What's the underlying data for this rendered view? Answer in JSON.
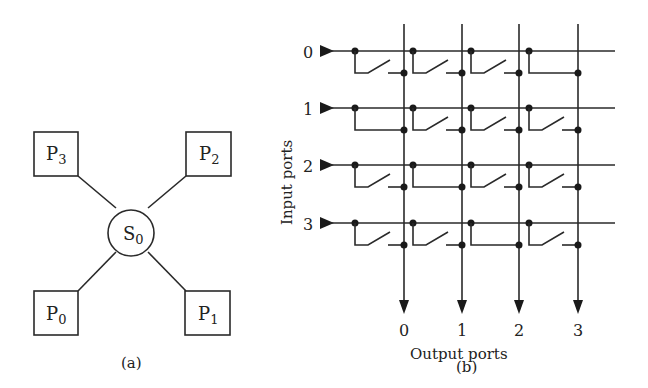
{
  "figure_a": {
    "caption": "(a)",
    "switch": {
      "label": "S",
      "sub": "0"
    },
    "processors": [
      {
        "id": "P0",
        "label": "P",
        "sub": "0",
        "position": "bottom-left"
      },
      {
        "id": "P1",
        "label": "P",
        "sub": "1",
        "position": "bottom-right"
      },
      {
        "id": "P2",
        "label": "P",
        "sub": "2",
        "position": "top-right"
      },
      {
        "id": "P3",
        "label": "P",
        "sub": "3",
        "position": "top-left"
      }
    ]
  },
  "figure_b": {
    "caption": "(b)",
    "input_axis_label": "Input ports",
    "output_axis_label": "Output ports",
    "input_ports": [
      "0",
      "1",
      "2",
      "3"
    ],
    "output_ports": [
      "0",
      "1",
      "2",
      "3"
    ],
    "closed_connections": [
      {
        "input": "0",
        "output": "3"
      },
      {
        "input": "1",
        "output": "0"
      },
      {
        "input": "2",
        "output": "1"
      },
      {
        "input": "3",
        "output": "2"
      }
    ]
  }
}
